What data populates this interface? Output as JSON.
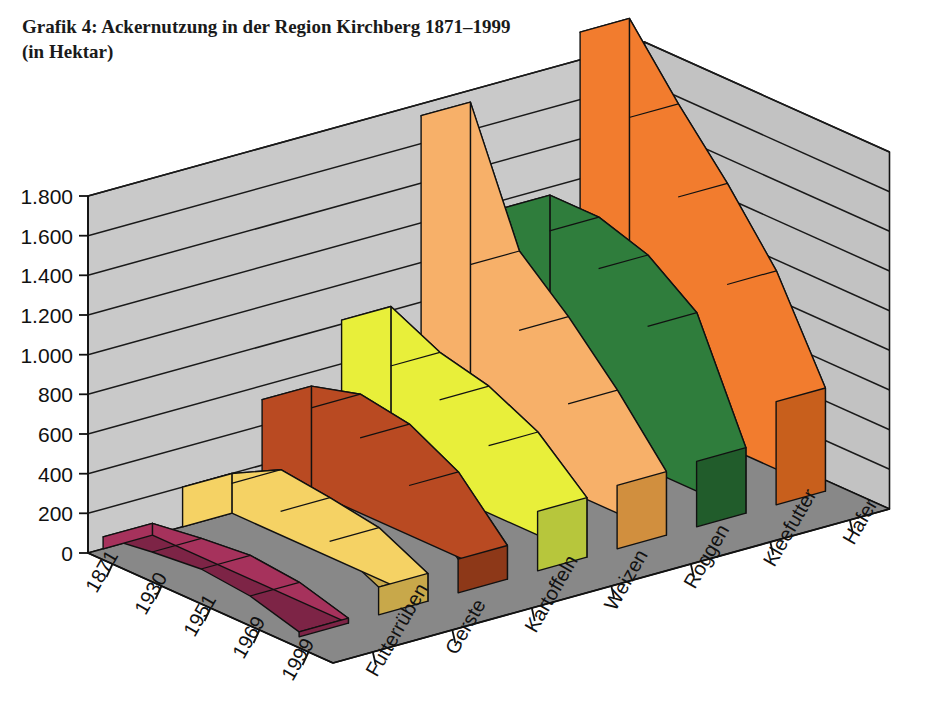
{
  "title": {
    "line1": "Grafik 4: Ackernutzung in der Region Kirchberg 1871–1999",
    "line2": "(in Hektar)"
  },
  "chart_data": {
    "type": "area",
    "title": "Grafik 4: Ackernutzung in der Region Kirchberg 1871–1999 (in Hektar)",
    "subtitle": "(in Hektar)",
    "xlabel": "",
    "ylabel": "",
    "zlabel": "",
    "ylim": [
      0,
      1800
    ],
    "grid": true,
    "legend": "none",
    "projection": "3d-ribbon",
    "yticks": [
      "0",
      "200",
      "400",
      "600",
      "800",
      "1.000",
      "1.200",
      "1.400",
      "1.600",
      "1.800"
    ],
    "ytick_values": [
      0,
      200,
      400,
      600,
      800,
      1000,
      1200,
      1400,
      1600,
      1800
    ],
    "categories": [
      "1871",
      "1930",
      "1951",
      "1969",
      "1999"
    ],
    "series": [
      {
        "name": "Futterrüben",
        "color": "#a6325c",
        "top_color": "#7d2446",
        "values": [
          60,
          95,
          120,
          95,
          25
        ]
      },
      {
        "name": "Gerste",
        "color": "#f5d264",
        "top_color": "#c8a84a",
        "values": [
          200,
          330,
          300,
          260,
          140
        ]
      },
      {
        "name": "Kartoffeln",
        "color": "#b94a22",
        "top_color": "#8d3818",
        "values": [
          530,
          600,
          560,
          430,
          170
        ]
      },
      {
        "name": "Weizen",
        "color": "#e8ef3a",
        "top_color": "#b7c63c",
        "values": [
          820,
          700,
          640,
          520,
          300
        ]
      },
      {
        "name": "Roggen",
        "color": "#f7b069",
        "top_color": "#d18f3e",
        "values": [
          1740,
          1100,
          880,
          620,
          320
        ]
      },
      {
        "name": "Kleefutter",
        "color": "#2f7d3c",
        "top_color": "#215c2b",
        "values": [
          1160,
          1160,
          1080,
          900,
          330
        ]
      },
      {
        "name": "Hafer",
        "color": "#f27c2e",
        "top_color": "#c85f1c",
        "values": [
          1940,
          1620,
          1330,
          1000,
          520
        ]
      }
    ]
  },
  "colors": {
    "wall": "#c9c9c9",
    "wall_side": "#c2c2c2",
    "floor": "#888888",
    "gridline": "#1a1a1a",
    "outline": "#111111",
    "text": "#111111"
  }
}
